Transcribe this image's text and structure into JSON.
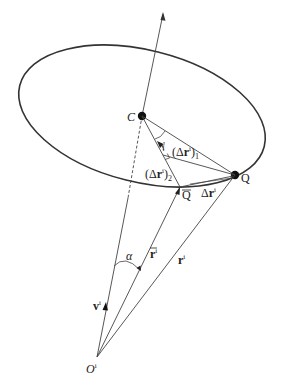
{
  "figure": {
    "type": "geometric-vector-diagram",
    "colors": {
      "stroke": "#333333",
      "text": "#222222",
      "background": "#ffffff"
    }
  },
  "points": {
    "C": {
      "label": "C",
      "x": 142,
      "y": 116
    },
    "Q": {
      "label": "Q",
      "x": 235,
      "y": 175
    },
    "Qbar": {
      "label": "Q",
      "x": 180,
      "y": 187
    },
    "O": {
      "label": "O",
      "sup": "i",
      "x": 97,
      "y": 357
    }
  },
  "labels": {
    "gamma": "γ",
    "delta_r1_open": "(Δ",
    "delta_r1_r": "r",
    "delta_r1_sup": "i",
    "delta_r1_close": ")",
    "delta_r1_sub": "1",
    "delta_r2_open": "(Δ",
    "delta_r2_r": "r",
    "delta_r2_sup": "i",
    "delta_r2_close": ")",
    "delta_r2_sub": "2",
    "delta_r_prefix": "Δ",
    "delta_r_r": "r",
    "delta_r_sup": "i",
    "alpha": "α",
    "rbar": "r",
    "rbar_sup": "i",
    "r": "r",
    "r_sup": "i",
    "v": "v",
    "v_sup": "i",
    "C": "C",
    "Q": "Q",
    "Qbar": "Q",
    "O": "O",
    "O_sup": "i"
  }
}
